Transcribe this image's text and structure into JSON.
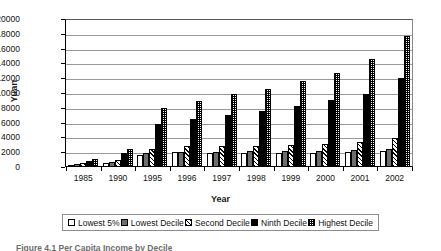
{
  "chart_data": {
    "type": "bar",
    "title": "",
    "xlabel": "Year",
    "ylabel": "Yuan",
    "ylim": [
      0,
      20000
    ],
    "ytick_step": 2000,
    "yticks": [
      "20000",
      "18000",
      "16000",
      "14000",
      "12000",
      "10000",
      "8000",
      "6000",
      "4000",
      "2000",
      "0"
    ],
    "grid": true,
    "legend_position": "bottom",
    "categories": [
      "1985",
      "1990",
      "1995",
      "1996",
      "1997",
      "1998",
      "1999",
      "2000",
      "2001",
      "2002"
    ],
    "series": [
      {
        "name": "Lowest 5%",
        "pattern": "white",
        "values": [
          320,
          560,
          1700,
          2000,
          1850,
          1900,
          1950,
          1900,
          2000,
          2150
        ]
      },
      {
        "name": "Lowest Decile",
        "pattern": "gray",
        "values": [
          380,
          700,
          1850,
          2050,
          2050,
          2150,
          2150,
          2150,
          2250,
          2500
        ]
      },
      {
        "name": "Second Decile",
        "pattern": "hatch",
        "values": [
          480,
          1000,
          2500,
          2800,
          2850,
          2900,
          3000,
          3100,
          3350,
          3950
        ]
      },
      {
        "name": "Ninth Decile",
        "pattern": "black",
        "values": [
          850,
          1850,
          5800,
          6600,
          7100,
          7600,
          8300,
          9100,
          10000,
          12100
        ]
      },
      {
        "name": "Highest Decile",
        "pattern": "check",
        "values": [
          1150,
          2400,
          8000,
          9000,
          9950,
          10550,
          11700,
          12850,
          14650,
          17800
        ]
      }
    ]
  },
  "axis": {
    "y_title": "Yuan",
    "x_title": "Year"
  },
  "legend": {
    "items": [
      {
        "label": "Lowest 5%",
        "pattern": "white"
      },
      {
        "label": "Lowest Decile",
        "pattern": "gray"
      },
      {
        "label": "Second Decile",
        "pattern": "hatch"
      },
      {
        "label": "Ninth Decile",
        "pattern": "black"
      },
      {
        "label": "Highest Decile",
        "pattern": "check"
      }
    ]
  },
  "caption": {
    "text": "Figure 4.1   Per Capita Income by Decile"
  }
}
